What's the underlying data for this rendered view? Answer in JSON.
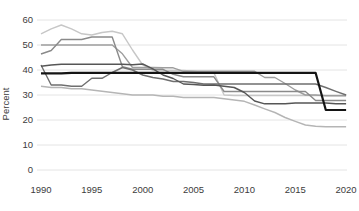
{
  "chart_data": {
    "type": "line",
    "title": "",
    "xlabel": "",
    "ylabel": "Percent",
    "xlim": [
      1990,
      2020
    ],
    "ylim": [
      0,
      60
    ],
    "grid": "horizontal",
    "legend": "none",
    "x_ticks": [
      1990,
      1995,
      2000,
      2005,
      2010,
      2015,
      2020
    ],
    "y_ticks": [
      0,
      10,
      20,
      30,
      40,
      50,
      60
    ],
    "x": [
      1990,
      1991,
      1992,
      1993,
      1994,
      1995,
      1996,
      1997,
      1998,
      1999,
      2000,
      2001,
      2002,
      2003,
      2004,
      2005,
      2006,
      2007,
      2008,
      2009,
      2010,
      2011,
      2012,
      2013,
      2014,
      2015,
      2016,
      2017,
      2018,
      2019,
      2020
    ],
    "series": [
      {
        "name": "series-1",
        "color": "#c7c7c7",
        "width": 1.4,
        "values": [
          54.5,
          56.5,
          58,
          56.5,
          54.5,
          54,
          55,
          55.5,
          54.5,
          48,
          42,
          39.8,
          39.8,
          39.8,
          39.8,
          39.5,
          39,
          38.9,
          30,
          29.8,
          29.8,
          29.8,
          29.8,
          29.8,
          29.8,
          29.8,
          29.8,
          29.8,
          29.8,
          29.8,
          29.8
        ]
      },
      {
        "name": "series-2",
        "color": "#b5b5b5",
        "width": 1.4,
        "values": [
          33.5,
          33,
          33,
          32.5,
          32.5,
          32,
          31.5,
          31,
          30.5,
          30,
          30,
          30,
          29.5,
          29.5,
          29,
          29,
          29,
          29,
          28.5,
          28,
          27.5,
          26,
          24.5,
          23,
          21,
          19.5,
          18,
          17.5,
          17.3,
          17.3,
          17.3
        ]
      },
      {
        "name": "series-3",
        "color": "#9e9e9e",
        "width": 1.4,
        "values": [
          50,
          50,
          50,
          50,
          50,
          50,
          50,
          50,
          46.5,
          41,
          41,
          41,
          40.9,
          40.9,
          39.5,
          39.5,
          39.5,
          39.5,
          39.5,
          39.5,
          39.5,
          39.5,
          37,
          37,
          34.6,
          32,
          30,
          30,
          29.7,
          29.7,
          29.7
        ]
      },
      {
        "name": "series-4",
        "color": "#8a8a8a",
        "width": 1.4,
        "values": [
          46.4,
          47.8,
          52.2,
          52.2,
          52.2,
          53.2,
          53.2,
          53.2,
          41.3,
          40.3,
          40.3,
          40.3,
          40.3,
          38.3,
          37.3,
          37.3,
          37.3,
          37.3,
          31.4,
          31.4,
          31.4,
          31.4,
          31.4,
          31.4,
          31.4,
          31.4,
          31.4,
          27.8,
          27.8,
          27.8,
          27.8
        ]
      },
      {
        "name": "series-5",
        "color": "#6f6f6f",
        "width": 1.4,
        "values": [
          42,
          34,
          34,
          33.5,
          33.5,
          36.7,
          36.7,
          39,
          41,
          40,
          38,
          37,
          36.4,
          35.4,
          35.4,
          35,
          34.4,
          34.4,
          34.4,
          34.4,
          34.4,
          34.4,
          34.4,
          34.4,
          34.4,
          34.4,
          34.4,
          34.4,
          33,
          31.5,
          30
        ]
      },
      {
        "name": "series-6",
        "color": "#565656",
        "width": 1.4,
        "values": [
          41.5,
          42,
          42.3,
          42.3,
          42.3,
          42.3,
          42.3,
          42.3,
          42.3,
          42.1,
          42.4,
          40.5,
          38,
          36.6,
          34.4,
          34.2,
          33.9,
          34,
          33.5,
          33,
          31,
          27.6,
          26.5,
          26.5,
          26.5,
          26.8,
          26.8,
          26.8,
          26.8,
          26.5,
          26.5
        ]
      },
      {
        "name": "series-7",
        "color": "#141414",
        "width": 2.2,
        "values": [
          38.7,
          38.7,
          38.7,
          38.9,
          38.9,
          38.9,
          38.9,
          38.9,
          38.9,
          38.9,
          38.9,
          38.9,
          38.9,
          38.9,
          38.9,
          38.9,
          38.9,
          38.9,
          38.9,
          38.9,
          38.9,
          38.9,
          38.9,
          38.9,
          38.9,
          38.9,
          38.9,
          38.9,
          24,
          24,
          24
        ]
      }
    ]
  }
}
